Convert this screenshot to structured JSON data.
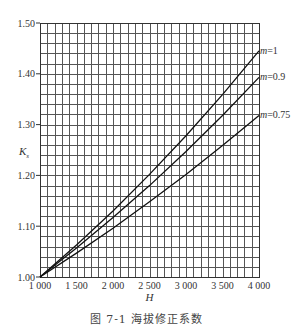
{
  "caption": "图 7-1   海拔修正系数",
  "chart_data": {
    "type": "line",
    "title": "图 7-1 海拔修正系数",
    "xlabel": "H",
    "ylabel": "Ks",
    "xlim": [
      1000,
      4000
    ],
    "ylim": [
      1.0,
      1.5
    ],
    "x_ticks": [
      1000,
      1500,
      2000,
      2500,
      3000,
      3500,
      4000
    ],
    "x_tick_labels": [
      "1 000",
      "1 500",
      "2 000",
      "2 500",
      "3 000",
      "3 500",
      "4 000"
    ],
    "y_ticks": [
      1.0,
      1.1,
      1.2,
      1.3,
      1.4,
      1.5
    ],
    "y_tick_labels": [
      "1.00",
      "1.10",
      "1.20",
      "1.30",
      "1.40",
      "1.50"
    ],
    "grid": true,
    "x_minor_step": 100,
    "y_minor_step": 0.02,
    "legend": "inline labels at right end of curves",
    "x": [
      1000,
      1500,
      2000,
      2500,
      3000,
      3500,
      4000
    ],
    "series": [
      {
        "name": "m=1",
        "values": [
          1.0,
          1.063,
          1.13,
          1.202,
          1.278,
          1.359,
          1.445
        ]
      },
      {
        "name": "m=0.9",
        "values": [
          1.0,
          1.057,
          1.117,
          1.18,
          1.247,
          1.318,
          1.393
        ]
      },
      {
        "name": "m=0.75",
        "values": [
          1.0,
          1.047,
          1.096,
          1.148,
          1.202,
          1.259,
          1.318
        ]
      }
    ]
  }
}
